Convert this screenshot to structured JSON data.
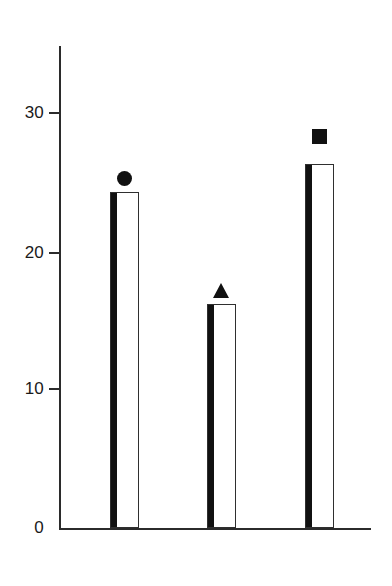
{
  "chart_data": {
    "type": "bar",
    "title": "",
    "subtitle": "",
    "xlabel": "",
    "ylabel": "",
    "categories": [
      "Circle",
      "Triangle",
      "Square"
    ],
    "values": [
      24,
      16,
      26
    ],
    "series": [
      {
        "name": "values",
        "values": [
          24,
          16,
          26
        ]
      }
    ],
    "ylim": [
      0,
      35
    ],
    "yticks": [
      0,
      10,
      20,
      30
    ],
    "ytick_labels": [
      "0",
      "10",
      "20",
      "30"
    ],
    "xticks": [],
    "xtick_labels": [],
    "grid": false,
    "legend": "none",
    "bar_style": "hollow-white-with-black-left-edge",
    "markers": [
      {
        "shape": "circle",
        "label": "●",
        "above_bar": 0,
        "value": 25
      },
      {
        "shape": "triangle",
        "label": "▲",
        "above_bar": 1,
        "value": 17
      },
      {
        "shape": "square",
        "label": "■",
        "above_bar": 2,
        "value": 28
      }
    ],
    "colors": {
      "axis": "#2b2b2b",
      "bar_fill": "#ffffff",
      "bar_outline": "#2f2f2f",
      "bar_left_edge": "#111111",
      "marker": "#111111",
      "background": "#ffffff",
      "tick_label": "#1a1a1a"
    }
  },
  "axis": {
    "y_tick_0": "0",
    "y_tick_10": "10",
    "y_tick_20": "20",
    "y_tick_30": "30"
  }
}
